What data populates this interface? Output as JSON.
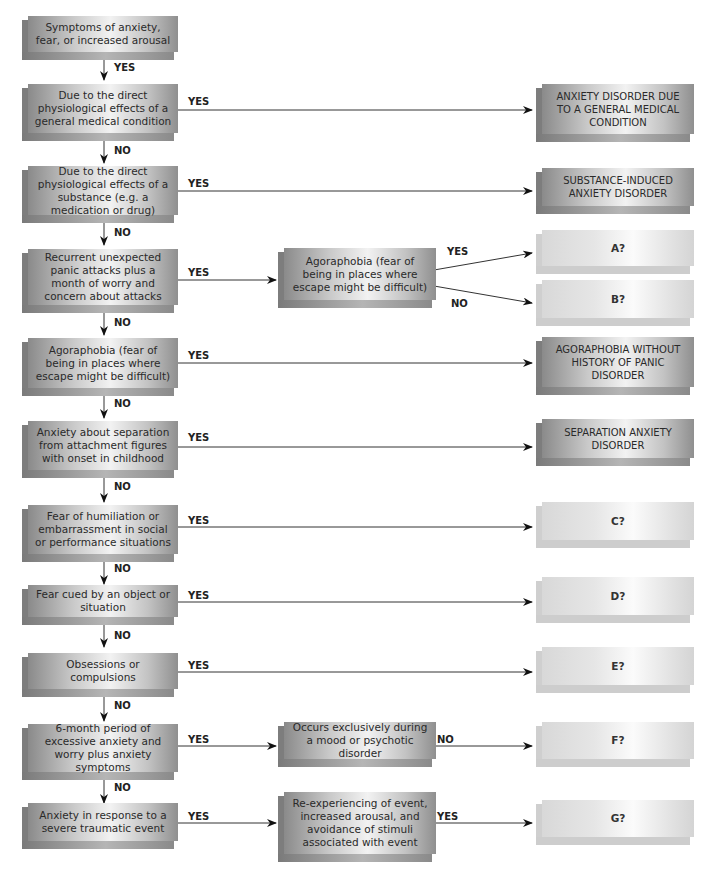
{
  "diagram": {
    "type": "decision-flowchart",
    "decisions": [
      {
        "id": "q0",
        "text": "Symptoms of anxiety, fear, or increased arousal"
      },
      {
        "id": "q1",
        "text": "Due to the direct physiological effects of a general medical condition"
      },
      {
        "id": "q2",
        "text": "Due to the direct physiological effects of a substance (e.g. a medication or drug)"
      },
      {
        "id": "q3",
        "text": "Recurrent unexpected panic attacks plus a month of worry and concern about attacks"
      },
      {
        "id": "q3b",
        "text": "Agoraphobia (fear of being in places where escape might be difficult)"
      },
      {
        "id": "q4",
        "text": "Agoraphobia (fear of being in places where escape might be difficult)"
      },
      {
        "id": "q5",
        "text": "Anxiety about separation from attachment figures with onset in childhood"
      },
      {
        "id": "q6",
        "text": "Fear of humiliation or embarrassment in social or performance situations"
      },
      {
        "id": "q7",
        "text": "Fear cued by an object or situation"
      },
      {
        "id": "q8",
        "text": "Obsessions or compulsions"
      },
      {
        "id": "q9",
        "text": "6-month period of excessive anxiety and worry plus anxiety symptoms"
      },
      {
        "id": "q9b",
        "text": "Occurs exclusively during a mood or psychotic disorder"
      },
      {
        "id": "q10",
        "text": "Anxiety in response to a severe traumatic event"
      },
      {
        "id": "q10b",
        "text": "Re-experiencing of event, increased arousal, and avoidance of stimuli associated with event"
      }
    ],
    "outcomes": [
      {
        "id": "o1",
        "text": "ANXIETY DISORDER DUE TO A GENERAL MEDICAL CONDITION"
      },
      {
        "id": "o2",
        "text": "SUBSTANCE-INDUCED ANXIETY DISORDER"
      },
      {
        "id": "oA",
        "text": "A?"
      },
      {
        "id": "oB",
        "text": "B?"
      },
      {
        "id": "o4",
        "text": "AGORAPHOBIA WITHOUT HISTORY OF PANIC DISORDER"
      },
      {
        "id": "o5",
        "text": "SEPARATION ANXIETY DISORDER"
      },
      {
        "id": "oC",
        "text": "C?"
      },
      {
        "id": "oD",
        "text": "D?"
      },
      {
        "id": "oE",
        "text": "E?"
      },
      {
        "id": "oF",
        "text": "F?"
      },
      {
        "id": "oG",
        "text": "G?"
      }
    ],
    "edge_labels": {
      "yes": "YES",
      "no": "NO"
    },
    "edges": [
      {
        "from": "q0",
        "to": "q1",
        "label": "YES"
      },
      {
        "from": "q1",
        "to": "o1",
        "label": "YES"
      },
      {
        "from": "q1",
        "to": "q2",
        "label": "NO"
      },
      {
        "from": "q2",
        "to": "o2",
        "label": "YES"
      },
      {
        "from": "q2",
        "to": "q3",
        "label": "NO"
      },
      {
        "from": "q3",
        "to": "q3b",
        "label": "YES"
      },
      {
        "from": "q3b",
        "to": "oA",
        "label": "YES"
      },
      {
        "from": "q3b",
        "to": "oB",
        "label": "NO"
      },
      {
        "from": "q3",
        "to": "q4",
        "label": "NO"
      },
      {
        "from": "q4",
        "to": "o4",
        "label": "YES"
      },
      {
        "from": "q4",
        "to": "q5",
        "label": "NO"
      },
      {
        "from": "q5",
        "to": "o5",
        "label": "YES"
      },
      {
        "from": "q5",
        "to": "q6",
        "label": "NO"
      },
      {
        "from": "q6",
        "to": "oC",
        "label": "YES"
      },
      {
        "from": "q6",
        "to": "q7",
        "label": "NO"
      },
      {
        "from": "q7",
        "to": "oD",
        "label": "YES"
      },
      {
        "from": "q7",
        "to": "q8",
        "label": "NO"
      },
      {
        "from": "q8",
        "to": "oE",
        "label": "YES"
      },
      {
        "from": "q8",
        "to": "q9",
        "label": "NO"
      },
      {
        "from": "q9",
        "to": "q9b",
        "label": "YES"
      },
      {
        "from": "q9b",
        "to": "oF",
        "label": "NO"
      },
      {
        "from": "q9",
        "to": "q10",
        "label": "NO"
      },
      {
        "from": "q10",
        "to": "q10b",
        "label": "YES"
      },
      {
        "from": "q10b",
        "to": "oG",
        "label": "YES"
      }
    ]
  }
}
